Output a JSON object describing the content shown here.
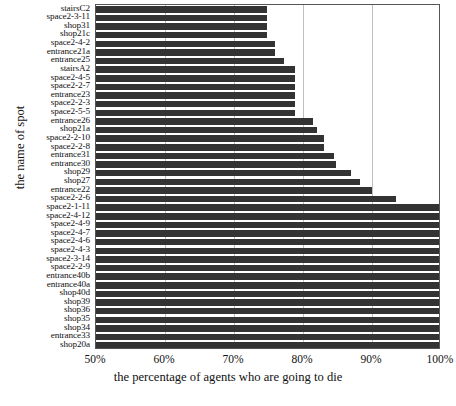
{
  "chart_data": {
    "type": "bar",
    "orientation": "horizontal",
    "title": "",
    "xlabel": "the percentage of agents who are going to die",
    "ylabel": "the name of spot",
    "xlim": [
      50,
      100
    ],
    "ylim": null,
    "grid": true,
    "legend": null,
    "xtick_labels": [
      "50%",
      "60%",
      "70%",
      "80%",
      "90%",
      "100%"
    ],
    "xtick_values": [
      50,
      60,
      70,
      80,
      90,
      100
    ],
    "bar_color": "#333333",
    "categories": [
      "stairsC2",
      "space2-3-11",
      "shop31",
      "shop21c",
      "space2-4-2",
      "entrance21a",
      "entrance25",
      "stairsA2",
      "space2-4-5",
      "space2-2-7",
      "entrance23",
      "space2-2-3",
      "space2-5-5",
      "entrance26",
      "shop21a",
      "space2-2-10",
      "space2-2-8",
      "entrance31",
      "entrance30",
      "shop29",
      "shop27",
      "entrance22",
      "space2-2-6",
      "space2-1-11",
      "space2-4-12",
      "space2-4-9",
      "space2-4-7",
      "space2-4-6",
      "space2-4-3",
      "space2-3-14",
      "space2-2-9",
      "entrance40b",
      "entrance40a",
      "shop40d",
      "shop39",
      "shop36",
      "shop35",
      "shop34",
      "entrance33",
      "shop20a"
    ],
    "values": [
      74.8,
      74.8,
      74.8,
      74.8,
      76.0,
      76.0,
      77.2,
      78.8,
      78.8,
      78.8,
      78.8,
      78.8,
      78.8,
      81.5,
      82.0,
      83.0,
      83.0,
      84.5,
      84.8,
      87.0,
      88.2,
      90.0,
      93.5,
      100,
      100,
      100,
      100,
      100,
      100,
      100,
      100,
      100,
      100,
      100,
      100,
      100,
      100,
      100,
      100,
      100
    ]
  }
}
